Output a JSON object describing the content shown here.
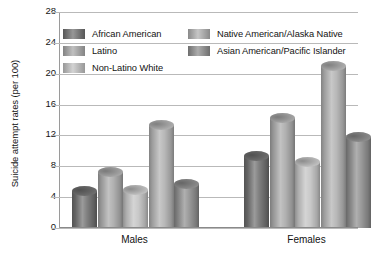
{
  "chart_data": {
    "type": "bar",
    "title": "",
    "xlabel": "",
    "ylabel": "Suicide attempt rates (per 100)",
    "categories": [
      "Males",
      "Females"
    ],
    "ylim": [
      0,
      28
    ],
    "yticks": [
      0,
      4,
      8,
      12,
      16,
      20,
      24,
      28
    ],
    "ytick_labels": [
      "0",
      "4",
      "8",
      "12",
      "16",
      "20",
      "24",
      "28"
    ],
    "grid": true,
    "legend_position": "upper-left-inside",
    "series": [
      {
        "name": "African American",
        "values": [
          4.8,
          9.3
        ],
        "color": "#6f6f6f"
      },
      {
        "name": "Latino",
        "values": [
          7.3,
          14.3
        ],
        "color": "#a8a8a8"
      },
      {
        "name": "Non-Latino White",
        "values": [
          4.9,
          8.6
        ],
        "color": "#c2c2c2"
      },
      {
        "name": "Native American/Alaska Native",
        "values": [
          13.3,
          21.0
        ],
        "color": "#b0b0b0"
      },
      {
        "name": "Asian American/Pacific Islander",
        "values": [
          5.7,
          11.8
        ],
        "color": "#8d8d8d"
      }
    ]
  },
  "legend": {
    "left_column": [
      "African American",
      "Latino",
      "Non-Latino White"
    ],
    "right_column": [
      "Native American/Alaska Native",
      "Asian American/Pacific Islander"
    ]
  },
  "axis": {
    "y_title": "Suicide attempt rates (per 100)",
    "group_labels": [
      "Males",
      "Females"
    ]
  }
}
